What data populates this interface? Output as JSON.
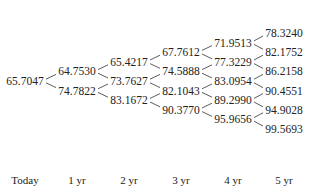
{
  "periods": [
    "Today",
    "1 yr",
    "2 yr",
    "3 yr",
    "4 yr",
    "5 yr"
  ],
  "tree": [
    [
      "65.7047"
    ],
    [
      "64.7530",
      "74.7822"
    ],
    [
      "65.4217",
      "73.7627",
      "83.1672"
    ],
    [
      "67.7612",
      "74.5888",
      "82.1043",
      "90.3770"
    ],
    [
      "71.9513",
      "77.3229",
      "83.0954",
      "89.2990",
      "95.9656"
    ],
    [
      "78.3240",
      "82.1752",
      "86.2158",
      "90.4551",
      "94.9028",
      "99.5693"
    ]
  ],
  "colors": {
    "text": "#222222",
    "line": "#333333",
    "background": "#ffffff"
  }
}
